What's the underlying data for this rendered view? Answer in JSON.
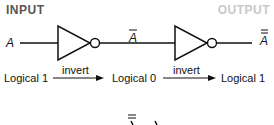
{
  "headers": {
    "input": "INPUT",
    "output": "OUTPUT"
  },
  "signals": {
    "input": "A",
    "middle": "A",
    "output": "A"
  },
  "states": [
    "Logical 1",
    "Logical 0",
    "Logical 1"
  ],
  "transitions": [
    "invert",
    "invert"
  ],
  "colors": {
    "input_header": "#555555",
    "output_header": "#c8c8c8",
    "line": "#111111"
  }
}
